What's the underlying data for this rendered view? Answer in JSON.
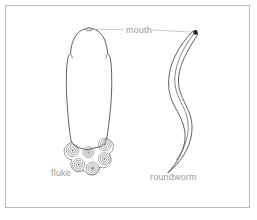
{
  "figure": {
    "background_color": "#ffffff",
    "frame_color": "#b9b9b9",
    "outline_color": "#3a3a3a",
    "label_color": "#9a9a9a",
    "leader_color": "#b5b5b5",
    "mouth_dot_color": "#1e1e1e"
  },
  "labels": {
    "mouth": "mouth",
    "fluke": "fluke",
    "roundworm": "roundworm"
  },
  "organisms": [
    {
      "name": "fluke",
      "label": "fluke",
      "feature": "mouth",
      "sucker_count": 6,
      "rings_per_sucker": 3
    },
    {
      "name": "roundworm",
      "label": "roundworm",
      "feature": "mouth",
      "sucker_count": 0,
      "rings_per_sucker": 0
    }
  ],
  "annotations": {
    "mouth_leader_left_target": "fluke head apex",
    "mouth_leader_right_target": "roundworm anterior tip"
  }
}
